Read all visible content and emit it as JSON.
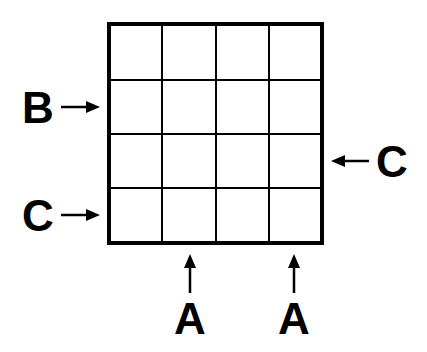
{
  "diagram": {
    "grid": {
      "rows": 4,
      "cols": 4,
      "line_color": "#000000"
    },
    "clues": [
      {
        "label": "B",
        "side": "left",
        "row": 2
      },
      {
        "label": "C",
        "side": "left",
        "row": 4
      },
      {
        "label": "C",
        "side": "right",
        "row": 3
      },
      {
        "label": "A",
        "side": "bottom",
        "col": 2
      },
      {
        "label": "A",
        "side": "bottom",
        "col": 4
      }
    ]
  }
}
